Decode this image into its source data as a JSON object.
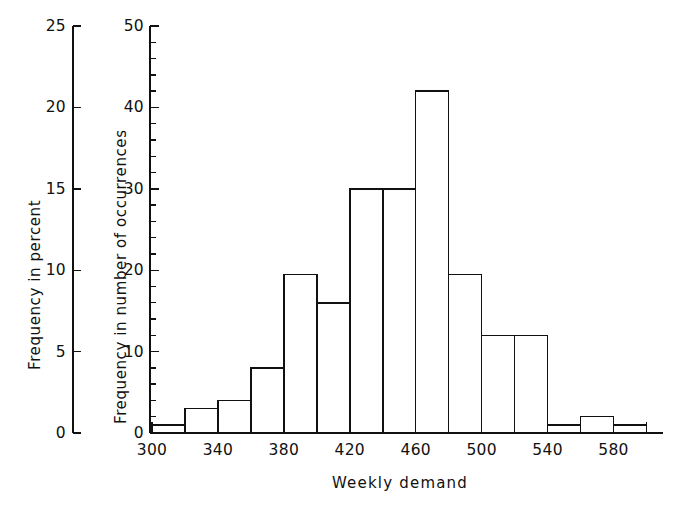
{
  "chart_data": {
    "type": "bar",
    "title": "",
    "xlabel": "Weekly demand",
    "ylabel": "Frequency in number of occurrences",
    "ylabel_secondary": "Frequency in percent",
    "grid": false,
    "legend": "none",
    "bin_width": 20,
    "bin_edges": [
      300,
      320,
      340,
      360,
      380,
      400,
      420,
      440,
      460,
      480,
      500,
      520,
      540,
      560,
      580,
      600
    ],
    "categories": [
      "300-320",
      "320-340",
      "340-360",
      "360-380",
      "380-400",
      "400-420",
      "420-440",
      "440-460",
      "460-480",
      "480-500",
      "500-520",
      "520-540",
      "540-560",
      "560-580",
      "580-600"
    ],
    "values": [
      1,
      3,
      4,
      8,
      19.5,
      16,
      30,
      30,
      42,
      19.5,
      12,
      12,
      1,
      2,
      1
    ],
    "x": [
      310,
      330,
      350,
      370,
      390,
      410,
      430,
      450,
      470,
      490,
      510,
      530,
      550,
      570,
      590
    ],
    "xlim": [
      300,
      610
    ],
    "ylim": [
      0,
      50
    ],
    "ylim_secondary": [
      0,
      25
    ],
    "xticks": [
      300,
      320,
      340,
      360,
      380,
      400,
      420,
      440,
      460,
      480,
      500,
      520,
      540,
      560,
      580,
      600
    ],
    "xtick_labels": [
      "300",
      "",
      "340",
      "",
      "380",
      "",
      "420",
      "",
      "460",
      "",
      "500",
      "",
      "540",
      "",
      "580",
      ""
    ],
    "yticks": [
      0,
      10,
      20,
      30,
      40,
      50
    ],
    "ytick_labels": [
      "0",
      "10",
      "20",
      "30",
      "40",
      "50"
    ],
    "ytick_minor_step": 2,
    "yticks_secondary": [
      0,
      5,
      10,
      15,
      20,
      25
    ],
    "ytick_labels_secondary": [
      "0",
      "5",
      "10",
      "15",
      "20",
      "25"
    ],
    "ytick_secondary_minor_step": 1,
    "line_color": "#111111",
    "bar_fill": "#ffffff",
    "background": "#ffffff"
  }
}
